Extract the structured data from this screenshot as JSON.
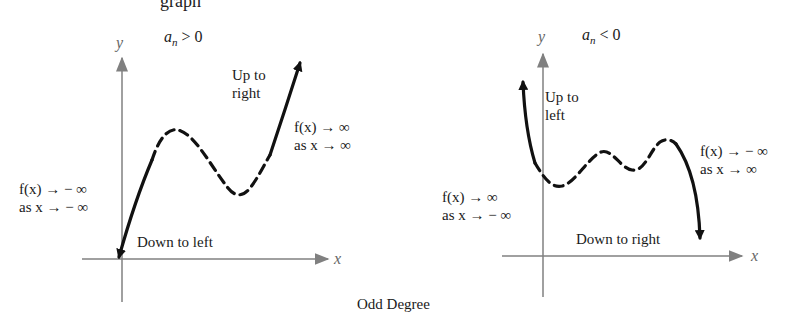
{
  "header": {
    "cut_text": "graph"
  },
  "caption": "Odd Degree",
  "panels": [
    {
      "condition": {
        "base": "a",
        "sub": "n",
        "rest": " > 0"
      },
      "axes": {
        "x": "x",
        "y": "y"
      },
      "labels": {
        "top_arrow": [
          "Up to",
          "right"
        ],
        "right_limit": [
          "f(x) → ∞",
          "as x → ∞"
        ],
        "left_limit": [
          "f(x) → − ∞",
          "as x → − ∞"
        ],
        "bottom_arrow": "Down to left"
      }
    },
    {
      "condition": {
        "base": "a",
        "sub": "n",
        "rest": " < 0"
      },
      "axes": {
        "x": "x",
        "y": "y"
      },
      "labels": {
        "top_arrow": [
          "Up to",
          "left"
        ],
        "right_limit": [
          "f(x) → − ∞",
          "as x → ∞"
        ],
        "left_limit": [
          "f(x) → ∞",
          "as x → − ∞"
        ],
        "bottom_arrow": "Down to right"
      }
    }
  ],
  "colors": {
    "axis": "#808080",
    "curve": "#111111"
  }
}
